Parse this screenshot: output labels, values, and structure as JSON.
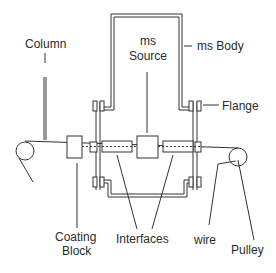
{
  "diagram": {
    "type": "schematic",
    "labels": {
      "column": "Column",
      "ms_source_line1": "ms",
      "ms_source_line2": "Source",
      "ms_body": "ms Body",
      "flange": "Flange",
      "coating_block_line1": "Coating",
      "coating_block_line2": "Block",
      "interfaces": "Interfaces",
      "wire": "wire",
      "pulley": "Pulley"
    },
    "colors": {
      "line": "#333333",
      "text": "#2b2b2b",
      "background": "#ffffff"
    }
  }
}
